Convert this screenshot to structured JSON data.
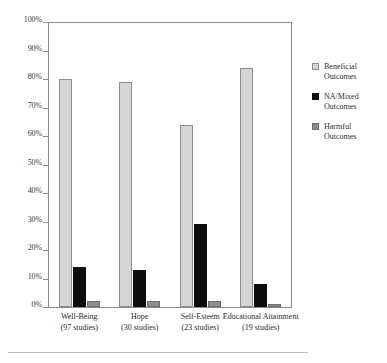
{
  "chart_data": {
    "type": "bar",
    "title": "",
    "xlabel": "",
    "ylabel": "",
    "ylim": [
      0,
      100
    ],
    "grid": false,
    "legend_position": "right",
    "categories": [
      "Well-Being",
      "Hope",
      "Self-Esteem",
      "Educational Attainment"
    ],
    "category_sublabels": [
      "(97 studies)",
      "(30 studies)",
      "(23 studies)",
      "(19 studies)"
    ],
    "ytick_labels": [
      "0%",
      "10%",
      "20%",
      "30%",
      "40%",
      "50%",
      "60%",
      "70%",
      "80%",
      "90%",
      "100%"
    ],
    "ytick_values": [
      0,
      10,
      20,
      30,
      40,
      50,
      60,
      70,
      80,
      90,
      100
    ],
    "series": [
      {
        "name": "Beneficial Outcomes",
        "color": "#d5d5d5",
        "values": [
          80,
          79,
          64,
          84
        ]
      },
      {
        "name": "NA/Mixed Outcomes",
        "color": "#0d0d0d",
        "values": [
          14,
          13,
          29,
          8
        ]
      },
      {
        "name": "Harmful Outcomes",
        "color": "#8e8e8e",
        "values": [
          2,
          2,
          2,
          1
        ]
      }
    ]
  },
  "legend": {
    "items": [
      {
        "label_line1": "Beneficial",
        "label_line2": "Outcomes",
        "swatch": "beneficial"
      },
      {
        "label_line1": "NA/Mixed",
        "label_line2": "Outcomes",
        "swatch": "namixed"
      },
      {
        "label_line1": "Harmful",
        "label_line2": "Outcomes",
        "swatch": "harmful"
      }
    ]
  }
}
